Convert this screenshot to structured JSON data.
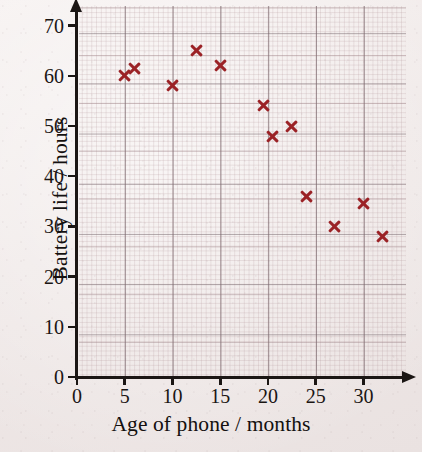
{
  "chart_data": {
    "type": "scatter",
    "title": "",
    "xlabel": "Age of phone / months",
    "ylabel": "Battery life / hours",
    "xlim": [
      0,
      34
    ],
    "ylim": [
      0,
      73
    ],
    "xticks": [
      0,
      5,
      10,
      15,
      20,
      25,
      30
    ],
    "yticks": [
      0,
      10,
      20,
      30,
      40,
      50,
      60,
      70
    ],
    "grid": true,
    "legend": "none",
    "marker": "x",
    "marker_color": "#9b2226",
    "points": [
      {
        "x": 5,
        "y": 60
      },
      {
        "x": 6,
        "y": 61.5
      },
      {
        "x": 10,
        "y": 58
      },
      {
        "x": 12.5,
        "y": 65
      },
      {
        "x": 15,
        "y": 62
      },
      {
        "x": 19.5,
        "y": 54
      },
      {
        "x": 20.5,
        "y": 48
      },
      {
        "x": 22.5,
        "y": 50
      },
      {
        "x": 24,
        "y": 36
      },
      {
        "x": 27,
        "y": 30
      },
      {
        "x": 30,
        "y": 34.5
      },
      {
        "x": 32,
        "y": 28
      }
    ]
  },
  "axes": {
    "x_title": "Age of phone / months",
    "y_title": "Battery life / hours",
    "x_tick_labels": [
      "0",
      "5",
      "10",
      "15",
      "20",
      "25",
      "30"
    ],
    "y_tick_labels": [
      "0",
      "10",
      "20",
      "30",
      "40",
      "50",
      "60",
      "70"
    ]
  },
  "colors": {
    "marker": "#9b2226",
    "axis": "#1b1614",
    "paper": "#f2eceb",
    "grid_minor": "#af9196",
    "grid_major": "#786a6e"
  }
}
